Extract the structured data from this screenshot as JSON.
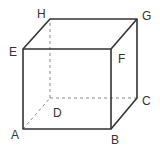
{
  "diagram": {
    "type": "cube",
    "vertices": {
      "A": {
        "x": 23,
        "y": 129,
        "label": "A"
      },
      "B": {
        "x": 111,
        "y": 129,
        "label": "B"
      },
      "C": {
        "x": 137,
        "y": 98,
        "label": "C"
      },
      "D": {
        "x": 50,
        "y": 98,
        "label": "D"
      },
      "E": {
        "x": 23,
        "y": 49,
        "label": "E"
      },
      "F": {
        "x": 111,
        "y": 49,
        "label": "F"
      },
      "G": {
        "x": 137,
        "y": 19,
        "label": "G"
      },
      "H": {
        "x": 50,
        "y": 19,
        "label": "H"
      }
    },
    "solid_edges": [
      "AB",
      "BF",
      "FE",
      "EA",
      "EH",
      "HG",
      "GF",
      "GC",
      "CB"
    ],
    "hidden_edges": [
      "AD",
      "DC",
      "DH"
    ],
    "line_color": "#333333",
    "hidden_line_color": "#777777"
  }
}
